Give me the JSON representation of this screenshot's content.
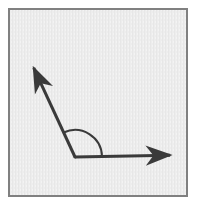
{
  "canvas": {
    "width": 197,
    "height": 207,
    "page_background": "#ffffff"
  },
  "frame": {
    "name": "diagram-border-frame",
    "x": 8,
    "y": 8,
    "width": 180,
    "height": 189,
    "border_color": "#808080",
    "border_width": 2,
    "fill_color": "#ededed",
    "texture": "subtle-vertical-paper-grain"
  },
  "figure": {
    "stroke_color": "#3a3a3a",
    "stroke_width": 3,
    "arc_stroke_width": 2,
    "vertex": {
      "name": "angle-vertex",
      "x": 75,
      "y": 157
    },
    "rays": [
      {
        "name": "horizontal-ray",
        "label": "right ray",
        "from": {
          "x": 75,
          "y": 157
        },
        "to": {
          "x": 179,
          "y": 155
        },
        "direction_degrees": 1,
        "arrowhead": true
      },
      {
        "name": "upper-left-ray",
        "label": "upper left ray",
        "from": {
          "x": 75,
          "y": 157
        },
        "to": {
          "x": 30,
          "y": 60
        },
        "direction_degrees": 115,
        "arrowhead": true
      }
    ],
    "arc": {
      "name": "angle-arc",
      "center": {
        "x": 75,
        "y": 157
      },
      "radius": 27,
      "start_degrees": 1,
      "end_degrees": 115,
      "measure_degrees": 114
    },
    "arrowhead": {
      "name": "arrowhead",
      "length": 16,
      "half_width": 7,
      "style": "solid-filled-triangle-barbed"
    }
  }
}
